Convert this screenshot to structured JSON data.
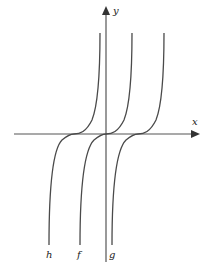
{
  "diagram": {
    "axes": {
      "x_label": "x",
      "y_label": "y"
    },
    "curves": [
      {
        "name": "h",
        "label": "h",
        "shift": -1
      },
      {
        "name": "f",
        "label": "f",
        "shift": 0
      },
      {
        "name": "g",
        "label": "g",
        "shift": 1
      }
    ],
    "colors": {
      "axis": "#555555",
      "curve": "#4a4a4a",
      "background": "#ffffff"
    }
  }
}
